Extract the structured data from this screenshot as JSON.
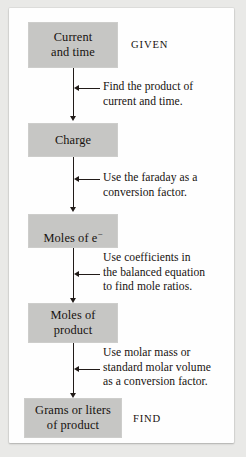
{
  "diagram": {
    "colors": {
      "box_fill": "#c6c6c4",
      "text": "#17120f",
      "line": "#211b18",
      "card_background": "#fefefe",
      "page_background": "#e9e9e7"
    },
    "nodes": [
      {
        "id": "current-and-time",
        "label": "Current\nand time"
      },
      {
        "id": "charge",
        "label": "Charge"
      },
      {
        "id": "moles-of-electrons",
        "label_prefix": "Moles of e",
        "label_superscript": "−"
      },
      {
        "id": "moles-of-product",
        "label": "Moles of\nproduct"
      },
      {
        "id": "grams-or-liters-of-product",
        "label": "Grams or liters\nof product"
      }
    ],
    "steps": [
      {
        "id": "step-1",
        "text": "Find the product of\ncurrent and time."
      },
      {
        "id": "step-2",
        "text": "Use the faraday as a\nconversion factor."
      },
      {
        "id": "step-3",
        "text": "Use coefficients in\nthe balanced equation\nto find mole ratios."
      },
      {
        "id": "step-4",
        "text": "Use molar mass or\nstandard molar volume\nas a conversion factor."
      }
    ],
    "side_labels": {
      "given": "GIVEN",
      "find": "FIND"
    }
  }
}
